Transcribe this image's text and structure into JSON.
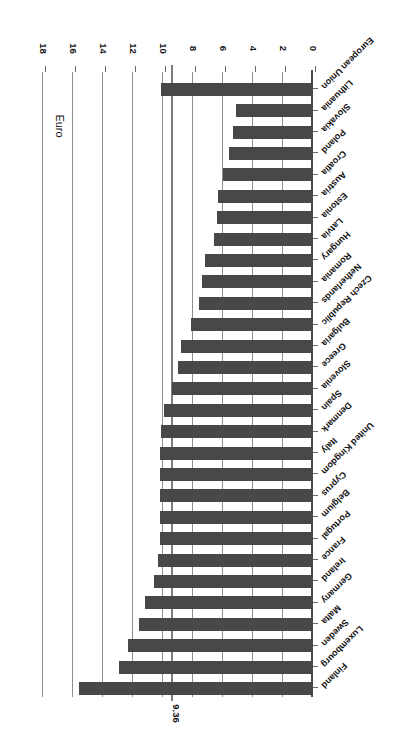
{
  "chart_data": {
    "type": "bar",
    "title": "",
    "subtitle": "",
    "orientation": "horizontal",
    "xlabel": "Euro",
    "ylabel": "",
    "axis_title": "Euro",
    "xlim": [
      0,
      18
    ],
    "grid": true,
    "gridlines_on": "value-axis",
    "legend": "none",
    "tick_labels": [
      "0",
      "2",
      "4",
      "6",
      "8",
      "10",
      "12",
      "14",
      "16",
      "18"
    ],
    "ticks": [
      0,
      2,
      4,
      6,
      8,
      10,
      12,
      14,
      16,
      18
    ],
    "tick_step": 2,
    "reference_line": {
      "value": 9.36,
      "label": "9.36",
      "color": "#7c7c7c"
    },
    "bar_color": "#484848",
    "categories": [
      "Finland",
      "Luxembourg",
      "Sweden",
      "Malta",
      "Germany",
      "Ireland",
      "France",
      "Portugal",
      "Belgium",
      "Cyprus",
      "United Kingdom",
      "Italy",
      "Denmark",
      "Spain",
      "Slovenia",
      "Greece",
      "Bulgaria",
      "Czech Republic",
      "Netherlands",
      "Romania",
      "Hungary",
      "Latvia",
      "Estonia",
      "Austria",
      "Croatia",
      "Poland",
      "Slovakia",
      "Lithuania",
      "European Union"
    ],
    "values": [
      15.6,
      12.9,
      12.3,
      11.6,
      11.2,
      10.6,
      10.3,
      10.2,
      10.2,
      10.2,
      10.2,
      10.2,
      10.1,
      9.9,
      9.4,
      9.0,
      8.8,
      8.1,
      7.6,
      7.4,
      7.2,
      6.6,
      6.4,
      6.3,
      6.0,
      5.6,
      5.3,
      5.1,
      10.1
    ],
    "highlight_category": "European Union"
  },
  "figure": {
    "rotation_degrees": 180,
    "background": "#ffffff"
  }
}
